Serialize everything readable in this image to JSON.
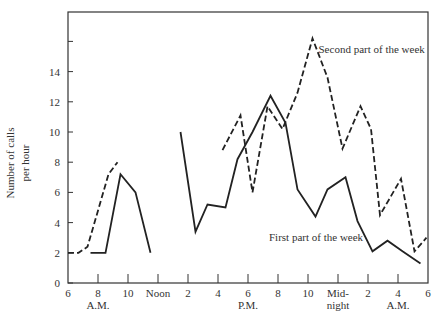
{
  "chart_data": {
    "type": "line",
    "title": "",
    "xlabel": "",
    "ylabel": "Number of calls per hour",
    "ylabel_lines": [
      "Number of calls",
      "per hour"
    ],
    "ylim": [
      0,
      18
    ],
    "xlim": [
      6,
      30
    ],
    "grid": false,
    "x_ticks": [
      {
        "pos": 6,
        "label": "6"
      },
      {
        "pos": 8,
        "label": "8"
      },
      {
        "pos": 10,
        "label": "10"
      },
      {
        "pos": 12,
        "label": "Noon"
      },
      {
        "pos": 14,
        "label": "2"
      },
      {
        "pos": 16,
        "label": "4"
      },
      {
        "pos": 18,
        "label": "6"
      },
      {
        "pos": 20,
        "label": "8"
      },
      {
        "pos": 22,
        "label": "10"
      },
      {
        "pos": 24,
        "label": "Mid-"
      },
      {
        "pos": 26,
        "label": "2"
      },
      {
        "pos": 28,
        "label": "4"
      },
      {
        "pos": 30,
        "label": "6"
      }
    ],
    "x_sublabels": [
      {
        "pos": 8,
        "label": "A.M."
      },
      {
        "pos": 18,
        "label": "P.M."
      },
      {
        "pos": 24,
        "label": "night"
      },
      {
        "pos": 28,
        "label": "A.M."
      }
    ],
    "y_ticks": [
      0,
      2,
      4,
      6,
      8,
      10,
      12,
      14,
      16
    ],
    "y_tick_labels": [
      "0",
      "2",
      "4",
      "6",
      "8",
      "10",
      "12",
      "14",
      ""
    ],
    "series": [
      {
        "name": "First part of the week",
        "style": "solid",
        "segments": [
          [
            [
              7.5,
              2
            ],
            [
              8.5,
              2
            ],
            [
              9.5,
              7.2
            ],
            [
              10.5,
              6
            ],
            [
              11.5,
              2
            ]
          ],
          [
            [
              13.5,
              10
            ],
            [
              14.5,
              3.4
            ],
            [
              15.3,
              5.2
            ],
            [
              16.5,
              5
            ],
            [
              17.3,
              8.2
            ],
            [
              18.3,
              10
            ],
            [
              19.5,
              12.4
            ],
            [
              20.5,
              10.6
            ],
            [
              21.3,
              6.2
            ],
            [
              22.5,
              4.4
            ],
            [
              23.3,
              6.2
            ],
            [
              24.5,
              7
            ],
            [
              25.3,
              4.1
            ],
            [
              26.3,
              2.1
            ],
            [
              27.3,
              2.8
            ],
            [
              28.3,
              2.1
            ],
            [
              29.5,
              1.3
            ]
          ]
        ]
      },
      {
        "name": "Second part of the week",
        "style": "dashed",
        "segments": [
          [
            [
              6,
              2
            ],
            [
              6.7,
              2
            ],
            [
              7.3,
              2.4
            ],
            [
              8.7,
              7.2
            ],
            [
              9.3,
              8
            ]
          ],
          [
            [
              16.3,
              8.8
            ],
            [
              17.5,
              11.1
            ],
            [
              18.3,
              6
            ],
            [
              19.3,
              11.7
            ],
            [
              20.3,
              10.2
            ],
            [
              21.3,
              12.6
            ],
            [
              22.3,
              16.2
            ],
            [
              23.3,
              13.6
            ],
            [
              24.3,
              8.9
            ],
            [
              25.5,
              11.7
            ],
            [
              26.2,
              10.2
            ],
            [
              26.8,
              4.5
            ],
            [
              28.2,
              6.9
            ],
            [
              29.1,
              2.1
            ],
            [
              29.9,
              3
            ]
          ]
        ]
      }
    ],
    "annotations": [
      {
        "text": "Second part of the week",
        "x": 22.7,
        "y": 15.2
      },
      {
        "text": "First part of the week",
        "x": 19.4,
        "y": 2.8
      }
    ]
  }
}
